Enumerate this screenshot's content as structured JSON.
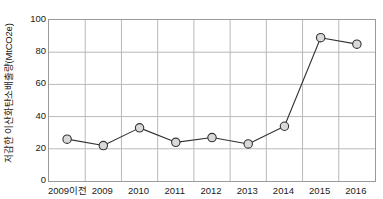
{
  "chart_data": {
    "type": "line",
    "title": "",
    "xlabel": "",
    "ylabel": "저감한 이산화탄소배출량(MtCO2e)",
    "categories": [
      "2009이전",
      "2009",
      "2010",
      "2011",
      "2012",
      "2013",
      "2014",
      "2015",
      "2016"
    ],
    "values": [
      26,
      22,
      33,
      24,
      27,
      23,
      34,
      89,
      85
    ],
    "ylim": [
      0,
      100
    ],
    "yticks": [
      0,
      20,
      40,
      60,
      80,
      100
    ],
    "ytick_labels": [
      "0",
      "20",
      "40",
      "60",
      "80",
      "100"
    ],
    "grid": "both",
    "legend": "none",
    "series": [
      {
        "name": "저감한 이산화탄소배출량",
        "values": [
          26,
          22,
          33,
          24,
          27,
          23,
          34,
          89,
          85
        ],
        "marker": "circle",
        "marker_fill": "#d9d9d9",
        "marker_edge": "#333333",
        "line_color": "#333333"
      }
    ]
  },
  "style": {
    "plot_border_color": "#9a9a9a",
    "grid_color": "#b9b9b9",
    "background": "#ffffff",
    "text_color": "#1a1a1a"
  }
}
